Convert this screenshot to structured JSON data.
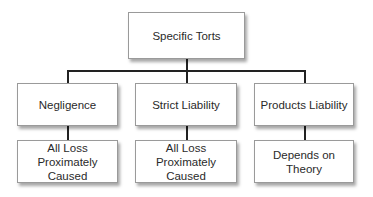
{
  "diagram": {
    "root": {
      "label": "Specific Torts"
    },
    "branches": [
      {
        "label": "Negligence",
        "outcome": {
          "line1": "All Loss",
          "line2": "Proximately Caused"
        }
      },
      {
        "label": "Strict Liability",
        "outcome": {
          "line1": "All Loss",
          "line2": "Proximately Caused"
        }
      },
      {
        "label": "Products Liability",
        "outcome": {
          "line1": "Depends on Theory",
          "line2": ""
        }
      }
    ]
  }
}
